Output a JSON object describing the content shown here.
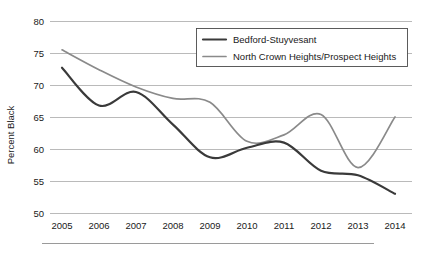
{
  "chart_data": {
    "type": "line",
    "title": "",
    "xlabel": "",
    "ylabel": "Percent Black",
    "x": [
      2005,
      2006,
      2007,
      2008,
      2009,
      2010,
      2011,
      2012,
      2013,
      2014
    ],
    "xtick_labels": [
      "2005",
      "2006",
      "2007",
      "2008",
      "2009",
      "2010",
      "2011",
      "2012",
      "2013",
      "2014"
    ],
    "ytick_labels": [
      "50",
      "55",
      "60",
      "65",
      "70",
      "75",
      "80"
    ],
    "yticks": [
      50,
      55,
      60,
      65,
      70,
      75,
      80
    ],
    "ylim": [
      50,
      80
    ],
    "xlim": [
      2005,
      2014
    ],
    "grid": "horizontal",
    "legend_position": "top-right",
    "series": [
      {
        "name": "Bedford-Stuyvesant",
        "color": "#3a3a3a",
        "values": [
          72.7,
          66.8,
          68.9,
          63.8,
          58.7,
          60.2,
          61.0,
          56.6,
          55.9,
          53.0
        ]
      },
      {
        "name": "North Crown Heights/Prospect Heights",
        "color": "#8a8a8a",
        "values": [
          75.5,
          72.4,
          69.7,
          67.9,
          67.3,
          61.2,
          62.2,
          65.4,
          57.1,
          65.0
        ]
      }
    ]
  },
  "legend": {
    "items": [
      {
        "label": "Bedford-Stuyvesant",
        "swatch_color": "#3a3a3a"
      },
      {
        "label": "North Crown Heights/Prospect Heights",
        "swatch_color": "#8a8a8a"
      }
    ]
  },
  "axes": {
    "y_title": "Percent Black"
  }
}
